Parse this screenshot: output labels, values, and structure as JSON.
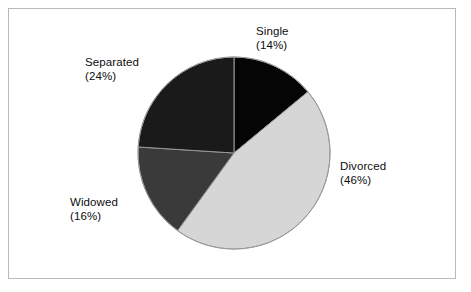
{
  "figure": {
    "background_color": "#ffffff",
    "frame_color": "#b9b9b9"
  },
  "chart_data": {
    "type": "pie",
    "title": "",
    "subtitle": "",
    "xlabel": "",
    "ylabel": "",
    "legend_position": "none",
    "grid": false,
    "start_angle_deg": 0,
    "direction": "clockwise",
    "categories": [
      "Single",
      "Divorced",
      "Widowed",
      "Separated"
    ],
    "values": [
      14,
      46,
      16,
      24
    ],
    "value_unit": "%",
    "total": 100,
    "slices": [
      {
        "label": "Single",
        "value": 14,
        "percent_text": "(14%)",
        "color": "#050505",
        "start_deg": 0,
        "end_deg": 50.4,
        "label_position": "top-right"
      },
      {
        "label": "Divorced",
        "value": 46,
        "percent_text": "(46%)",
        "color": "#d6d6d6",
        "start_deg": 50.4,
        "end_deg": 216.0,
        "label_position": "right"
      },
      {
        "label": "Widowed",
        "value": 16,
        "percent_text": "(16%)",
        "color": "#3a3a3a",
        "start_deg": 216.0,
        "end_deg": 273.6,
        "label_position": "bottom-left"
      },
      {
        "label": "Separated",
        "value": 24,
        "percent_text": "(24%)",
        "color": "#1a1a1a",
        "start_deg": 273.6,
        "end_deg": 360.0,
        "label_position": "top-left"
      }
    ],
    "slice_outline_color": "#9a9a9a",
    "geometry": {
      "center_x": 234,
      "center_y": 153,
      "radius": 96
    }
  },
  "labels": {
    "single": {
      "name": "Single",
      "percent": "(14%)"
    },
    "divorced": {
      "name": "Divorced",
      "percent": "(46%)"
    },
    "widowed": {
      "name": "Widowed",
      "percent": "(16%)"
    },
    "separated": {
      "name": "Separated",
      "percent": "(24%)"
    }
  }
}
